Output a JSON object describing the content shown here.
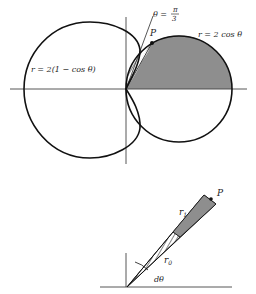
{
  "figure_top": {
    "labels": {
      "cardioid": "r = 2(1 − cos θ)",
      "circle": "r = 2 cos θ",
      "angle_theta": "θ =",
      "angle_num": "π",
      "angle_den": "3",
      "point": "P"
    },
    "colors": {
      "shade": "#8e8e8e",
      "stroke": "#111111"
    }
  },
  "figure_bottom": {
    "labels": {
      "point": "P",
      "r1": "r",
      "r1_sub": "1",
      "r0": "r",
      "r0_sub": "0",
      "dtheta": "dθ"
    },
    "colors": {
      "shade": "#8e8e8e",
      "stroke": "#111111"
    }
  }
}
